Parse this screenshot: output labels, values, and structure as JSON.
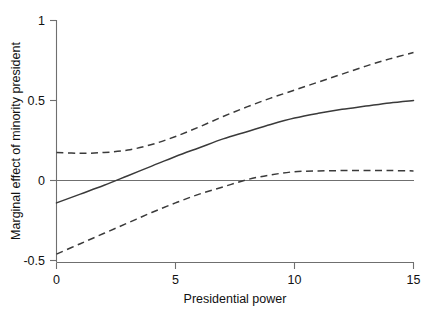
{
  "chart_data": {
    "type": "line",
    "title": "",
    "xlabel": "Presidential power",
    "ylabel": "Marginal effect of minority president",
    "xlim": [
      0,
      15
    ],
    "ylim": [
      -0.5,
      1
    ],
    "xticks": [
      0,
      5,
      10,
      15
    ],
    "xticklabels": [
      "0",
      "5",
      "10",
      "15"
    ],
    "yticks": [
      -0.5,
      0,
      0.5,
      1
    ],
    "yticklabels": [
      "-0.5",
      "0",
      "0.5",
      "1"
    ],
    "grid": false,
    "legend": "none",
    "zero_reference_line": 0,
    "x": [
      0,
      1,
      2,
      3,
      4,
      5,
      6,
      7,
      8,
      9,
      10,
      11,
      12,
      13,
      14,
      15
    ],
    "series": [
      {
        "name": "Marginal effect (point estimate)",
        "style": "solid",
        "values": [
          -0.14,
          -0.085,
          -0.03,
          0.03,
          0.09,
          0.15,
          0.205,
          0.26,
          0.305,
          0.35,
          0.39,
          0.42,
          0.445,
          0.465,
          0.485,
          0.5
        ]
      },
      {
        "name": "Upper 95% confidence bound",
        "style": "dashed",
        "values": [
          0.175,
          0.17,
          0.175,
          0.19,
          0.225,
          0.275,
          0.335,
          0.4,
          0.46,
          0.515,
          0.565,
          0.615,
          0.665,
          0.715,
          0.76,
          0.8
        ]
      },
      {
        "name": "Lower 95% confidence bound",
        "style": "dashed",
        "values": [
          -0.46,
          -0.395,
          -0.33,
          -0.265,
          -0.2,
          -0.14,
          -0.085,
          -0.04,
          0.005,
          0.035,
          0.055,
          0.06,
          0.062,
          0.062,
          0.062,
          0.06
        ]
      }
    ],
    "annotations": {
      "solid_zero_crossing_x": 2.7,
      "lower_bound_zero_crossing_x": 7.0
    },
    "colors": {
      "curve": "#3a3a3a",
      "axis": "#6f6f6f",
      "background": "#ffffff",
      "text": "#111111"
    }
  }
}
